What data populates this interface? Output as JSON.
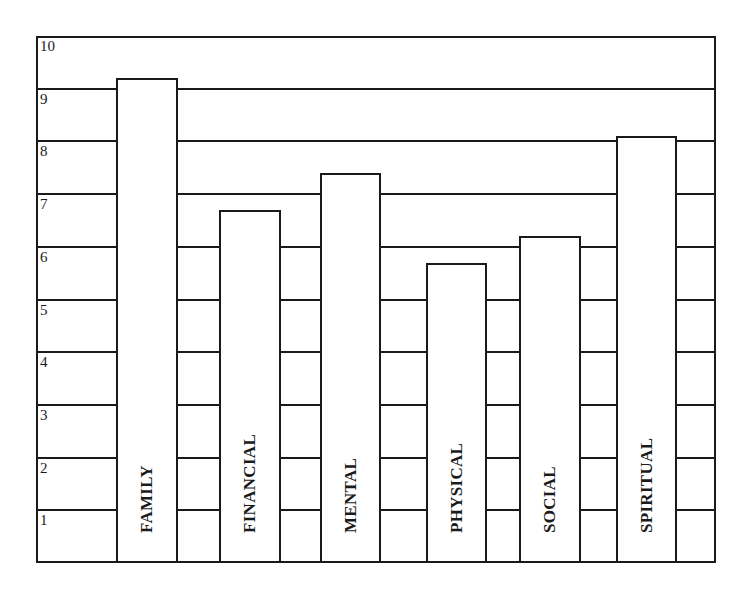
{
  "chart_data": {
    "type": "bar",
    "title": "",
    "xlabel": "",
    "ylabel": "",
    "categories": [
      "FAMILY",
      "FINANCIAL",
      "MENTAL",
      "PHYSICAL",
      "SOCIAL",
      "SPIRITUAL"
    ],
    "values": [
      9.2,
      6.7,
      7.4,
      5.7,
      6.2,
      8.1
    ],
    "ylim": [
      0,
      10
    ],
    "yticks": [
      1,
      2,
      3,
      4,
      5,
      6,
      7,
      8,
      9,
      10
    ],
    "grid": true,
    "legend": null,
    "label_orientation": "vertical-inside-bar",
    "colors": {
      "line": "#1a1a1a",
      "bar_fill": "#ffffff",
      "background": "#ffffff"
    }
  },
  "layout": {
    "plot": {
      "left": 36,
      "top": 36,
      "right": 716,
      "bottom": 563
    },
    "bars_x": [
      [
        116,
        178
      ],
      [
        219,
        281
      ],
      [
        320,
        381
      ],
      [
        426,
        487
      ],
      [
        519,
        581
      ],
      [
        616,
        677
      ]
    ]
  }
}
